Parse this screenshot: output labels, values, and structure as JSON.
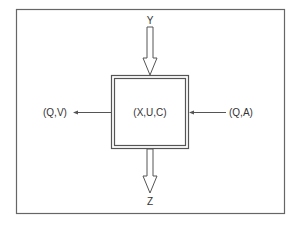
{
  "diagram": {
    "type": "block-diagram",
    "colors": {
      "stroke": "#555555",
      "frame": "#666666",
      "text": "#333333",
      "background": "#ffffff"
    },
    "central_block": {
      "label": "(X,U,C)",
      "border": "double"
    },
    "inputs": {
      "top": {
        "label": "Y",
        "arrow_style": "hollow-double-line",
        "direction": "into-block"
      },
      "right": {
        "label": "(Q,A)",
        "arrow_style": "thin-line",
        "direction": "into-block"
      }
    },
    "outputs": {
      "bottom": {
        "label": "Z",
        "arrow_style": "hollow-double-line",
        "direction": "out-of-block"
      },
      "left": {
        "label": "(Q,V)",
        "arrow_style": "thin-line",
        "direction": "out-of-block"
      }
    }
  }
}
